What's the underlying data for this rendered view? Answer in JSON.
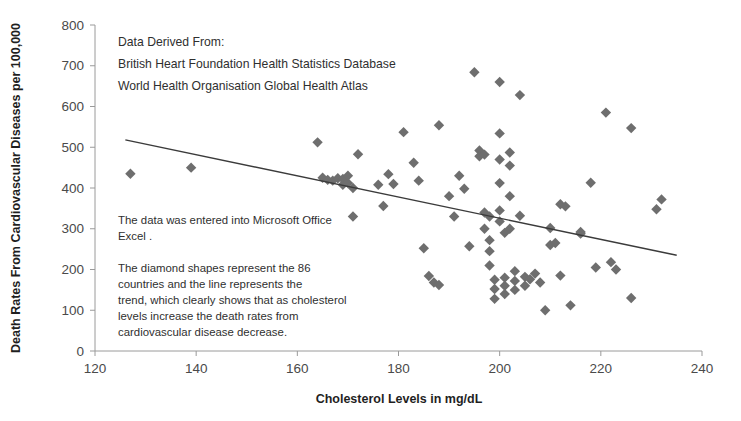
{
  "chart_data": {
    "type": "scatter",
    "title": "",
    "xlabel": "Cholesterol Levels  in mg/dL",
    "ylabel": "Death Rates From Cardiovascular Diseases per 100,000",
    "xlim": [
      120,
      240
    ],
    "ylim": [
      0,
      800
    ],
    "xticks": [
      120,
      140,
      160,
      180,
      200,
      220,
      240
    ],
    "yticks": [
      0,
      100,
      200,
      300,
      400,
      500,
      600,
      700,
      800
    ],
    "grid": false,
    "legend": "none",
    "marker_shape": "diamond",
    "marker_color": "#6e6e6e",
    "trend_color": "#3b3b3b",
    "n_points": 86,
    "series": [
      {
        "name": "Countries",
        "points": [
          [
            127,
            435
          ],
          [
            139,
            450
          ],
          [
            164,
            512
          ],
          [
            165,
            425
          ],
          [
            166,
            420
          ],
          [
            167,
            418
          ],
          [
            168,
            424
          ],
          [
            169,
            422
          ],
          [
            169,
            408
          ],
          [
            170,
            412
          ],
          [
            170,
            430
          ],
          [
            171,
            400
          ],
          [
            171,
            330
          ],
          [
            172,
            483
          ],
          [
            176,
            408
          ],
          [
            177,
            356
          ],
          [
            178,
            434
          ],
          [
            179,
            410
          ],
          [
            181,
            537
          ],
          [
            183,
            462
          ],
          [
            184,
            418
          ],
          [
            185,
            252
          ],
          [
            186,
            184
          ],
          [
            187,
            168
          ],
          [
            188,
            162
          ],
          [
            188,
            554
          ],
          [
            190,
            380
          ],
          [
            191,
            330
          ],
          [
            192,
            430
          ],
          [
            193,
            398
          ],
          [
            194,
            257
          ],
          [
            195,
            684
          ],
          [
            196,
            492
          ],
          [
            196,
            478
          ],
          [
            197,
            482
          ],
          [
            197,
            340
          ],
          [
            197,
            300
          ],
          [
            198,
            330
          ],
          [
            198,
            272
          ],
          [
            198,
            245
          ],
          [
            198,
            210
          ],
          [
            199,
            175
          ],
          [
            199,
            152
          ],
          [
            199,
            128
          ],
          [
            200,
            660
          ],
          [
            200,
            534
          ],
          [
            200,
            470
          ],
          [
            200,
            412
          ],
          [
            200,
            345
          ],
          [
            200,
            318
          ],
          [
            201,
            290
          ],
          [
            201,
            180
          ],
          [
            201,
            160
          ],
          [
            201,
            140
          ],
          [
            202,
            487
          ],
          [
            202,
            455
          ],
          [
            202,
            380
          ],
          [
            202,
            300
          ],
          [
            203,
            196
          ],
          [
            203,
            172
          ],
          [
            203,
            150
          ],
          [
            204,
            628
          ],
          [
            204,
            332
          ],
          [
            205,
            182
          ],
          [
            205,
            160
          ],
          [
            206,
            176
          ],
          [
            207,
            190
          ],
          [
            208,
            168
          ],
          [
            209,
            100
          ],
          [
            210,
            302
          ],
          [
            210,
            260
          ],
          [
            211,
            265
          ],
          [
            212,
            360
          ],
          [
            212,
            185
          ],
          [
            213,
            355
          ],
          [
            214,
            112
          ],
          [
            216,
            288
          ],
          [
            216,
            292
          ],
          [
            218,
            413
          ],
          [
            219,
            205
          ],
          [
            221,
            585
          ],
          [
            222,
            218
          ],
          [
            223,
            200
          ],
          [
            226,
            547
          ],
          [
            226,
            130
          ],
          [
            231,
            348
          ],
          [
            232,
            372
          ]
        ]
      }
    ],
    "trendline": {
      "x_start": 126,
      "y_start": 518,
      "x_end": 235,
      "y_end": 235
    }
  },
  "annotations": {
    "source_block": [
      "Data Derived From:",
      "British Heart Foundation Health Statistics Database",
      "World Health Organisation Global Health Atlas"
    ],
    "method_block": [
      "The data was entered into Microsoft Office",
      "Excel ."
    ],
    "explain_block": [
      "The diamond shapes represent the  86",
      "countries and the line represents the",
      "trend, which clearly shows that as cholesterol",
      "levels increase the death rates from",
      "cardiovascular disease decrease."
    ]
  }
}
